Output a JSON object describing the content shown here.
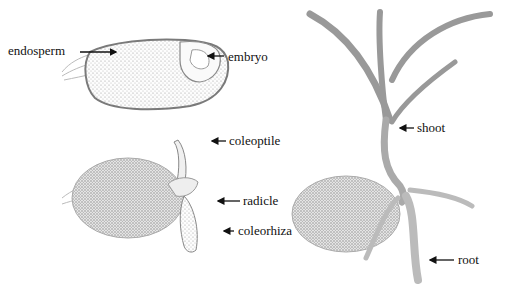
{
  "diagram": {
    "labels": {
      "endosperm": "endosperm",
      "embryo": "embryo",
      "coleoptile": "coleoptile",
      "radicle": "radicle",
      "coleorhiza": "coleorhiza",
      "shoot": "shoot",
      "root": "root"
    },
    "colors": {
      "background": "#ffffff",
      "ink": "#111111",
      "stipple": "#9a9a9a",
      "outline": "#7a7a7a"
    }
  }
}
